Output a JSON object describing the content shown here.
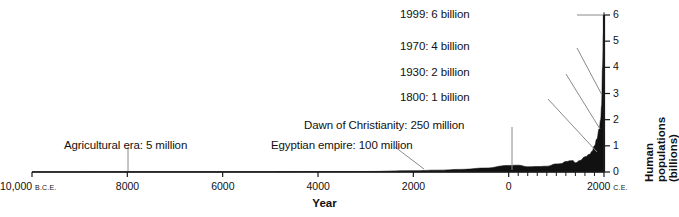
{
  "chart_data": {
    "type": "area",
    "title": "",
    "xlabel": "Year",
    "ylabel": "Human populations (billions)",
    "xlim": [
      -10000,
      2000
    ],
    "ylim": [
      0,
      6
    ],
    "grid": false,
    "legend": "none",
    "x_ticks": [
      {
        "value": -10000,
        "label": "10,000",
        "era": "B.C.E."
      },
      {
        "value": -8000,
        "label": "8000",
        "era": ""
      },
      {
        "value": -6000,
        "label": "6000",
        "era": ""
      },
      {
        "value": -4000,
        "label": "4000",
        "era": ""
      },
      {
        "value": -2000,
        "label": "2000",
        "era": ""
      },
      {
        "value": 0,
        "label": "0",
        "era": ""
      },
      {
        "value": 2000,
        "label": "2000",
        "era": "C.E."
      }
    ],
    "x_minor_ticks": [
      200,
      400,
      600,
      800,
      1000,
      1200,
      1400,
      1600,
      1800
    ],
    "y_ticks": [
      {
        "value": 0,
        "label": "0"
      },
      {
        "value": 1,
        "label": "1"
      },
      {
        "value": 2,
        "label": "2"
      },
      {
        "value": 3,
        "label": "3"
      },
      {
        "value": 4,
        "label": "4"
      },
      {
        "value": 5,
        "label": "5"
      },
      {
        "value": 6,
        "label": "6"
      }
    ],
    "x": [
      -10000,
      -9000,
      -8000,
      -7000,
      -6000,
      -5000,
      -4000,
      -3000,
      -2000,
      -1500,
      -1000,
      -500,
      0,
      200,
      400,
      600,
      800,
      1000,
      1100,
      1200,
      1300,
      1340,
      1400,
      1500,
      1600,
      1700,
      1750,
      1800,
      1850,
      1900,
      1930,
      1950,
      1970,
      1990,
      1999,
      2000
    ],
    "values": [
      0.004,
      0.004,
      0.005,
      0.006,
      0.007,
      0.01,
      0.015,
      0.02,
      0.05,
      0.07,
      0.1,
      0.15,
      0.25,
      0.26,
      0.2,
      0.21,
      0.22,
      0.31,
      0.32,
      0.4,
      0.43,
      0.44,
      0.35,
      0.44,
      0.58,
      0.68,
      0.79,
      1.0,
      1.26,
      1.65,
      2.0,
      2.52,
      4.0,
      5.3,
      6.0,
      6.1
    ],
    "annotations": [
      {
        "id": "agricultural-era",
        "text": "Agricultural era: 5 million",
        "year": -8000,
        "population": 0.005
      },
      {
        "id": "egyptian-empire",
        "text": "Egyptian empire: 100 million",
        "year": -1000,
        "population": 0.1
      },
      {
        "id": "dawn-of-christianity",
        "text": "Dawn of Christianity: 250 million",
        "year": 0,
        "population": 0.25
      },
      {
        "id": "1800-1-billion",
        "text": "1800: 1 billion",
        "year": 1800,
        "population": 1
      },
      {
        "id": "1930-2-billion",
        "text": "1930: 2 billion",
        "year": 1930,
        "population": 2
      },
      {
        "id": "1970-4-billion",
        "text": "1970: 4 billion",
        "year": 1970,
        "population": 4
      },
      {
        "id": "1999-6-billion",
        "text": "1999: 6 billion",
        "year": 1999,
        "population": 6
      }
    ],
    "colors": {
      "area_fill": "#111111",
      "axis": "#1a1a1a",
      "leader_line": "#6b6b6b",
      "background": "#ffffff"
    }
  }
}
